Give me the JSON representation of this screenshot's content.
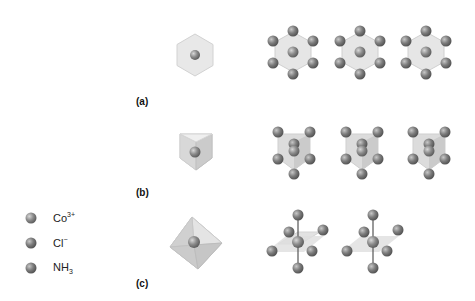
{
  "figure": {
    "panels": [
      {
        "label": "(a)",
        "view": "top view along three-fold axis"
      },
      {
        "label": "(b)",
        "view": "view along two-fold axis"
      },
      {
        "label": "(c)",
        "view": "perspective octahedral view"
      }
    ]
  },
  "legend": {
    "items": [
      {
        "name": "Co",
        "sup": "3+",
        "sub": "",
        "color": "#8f8f8f"
      },
      {
        "name": "Cl",
        "sup": "−",
        "sub": "",
        "color": "#858585"
      },
      {
        "name": "NH",
        "sup": "",
        "sub": "3",
        "color": "#7a7a7a"
      }
    ]
  },
  "colors": {
    "polyhedron_fill": "#e6e6e6",
    "polyhedron_edge": "#cfcfcf",
    "atom_dark": "#6e6e6e",
    "atom_light": "#b5b5b5",
    "bond": "#555555"
  }
}
